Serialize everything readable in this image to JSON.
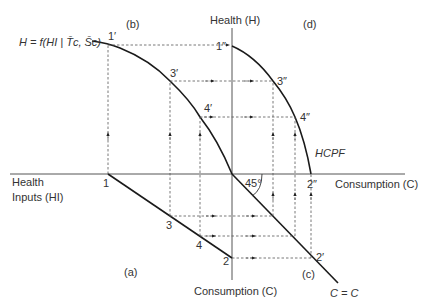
{
  "diagram": {
    "axes": {
      "health_axis_label": "Health (H)",
      "consumption_axis_right_label": "Consumption (C)",
      "consumption_axis_bottom_label": "Consumption (C)",
      "health_inputs_label_line1": "Health",
      "health_inputs_label_line2": "Inputs (HI)"
    },
    "quadrants": {
      "a": "(a)",
      "b": "(b)",
      "c": "(c)",
      "d": "(d)"
    },
    "curves": {
      "production_function": "H = f(HI | T̄c, S̄c)",
      "hcpf": "HCPF",
      "identity_line": "C = C",
      "angle": "45°"
    },
    "points": {
      "p1": "1",
      "p2": "2",
      "p3": "3",
      "p4": "4",
      "p1_prime": "1′",
      "p3_prime": "3′",
      "p4_prime": "4′",
      "p2_prime": "2′",
      "p1_dprime": "1″",
      "p2_dprime": "2″",
      "p3_dprime": "3″",
      "p4_dprime": "4″"
    }
  }
}
